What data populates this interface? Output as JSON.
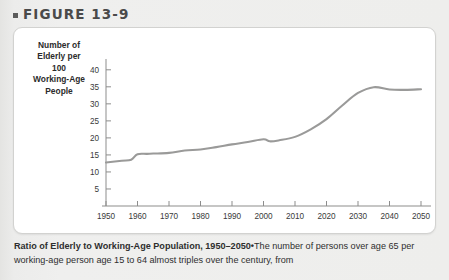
{
  "figure": {
    "marker": "▪",
    "label": "FIGURE 13-9"
  },
  "axis_label": {
    "line1": "Number of",
    "line2": "Elderly per",
    "line3": "100",
    "line4": "Working-Age",
    "line5": "People"
  },
  "caption": {
    "bold": "Ratio of Elderly to Working-Age Population, 1950–2050",
    "separator": "•",
    "text1": "The number of persons",
    "text2": "over age 65 per working-age person age 15 to 64 almost triples over the century, from"
  },
  "colors": {
    "line": "#9a9a99",
    "axis": "#8d8d8c",
    "panel_bg": "#ffffff",
    "page_bg": "#ededeb",
    "text": "#2b2b2b"
  },
  "chart_data": {
    "type": "line",
    "title": "Ratio of Elderly to Working-Age Population, 1950–2050",
    "xlabel": "",
    "ylabel": "Number of Elderly per 100 Working-Age People",
    "xlim": [
      1950,
      2050
    ],
    "ylim": [
      0,
      42
    ],
    "xticks": [
      1950,
      1960,
      1970,
      1980,
      1990,
      2000,
      2010,
      2020,
      2030,
      2040,
      2050
    ],
    "yticks": [
      5,
      10,
      15,
      20,
      25,
      30,
      35,
      40
    ],
    "grid": false,
    "legend": false,
    "series": [
      {
        "name": "Elderly per 100 working-age people",
        "x": [
          1950,
          1955,
          1958,
          1960,
          1963,
          1965,
          1970,
          1975,
          1980,
          1985,
          1990,
          1995,
          2000,
          2002,
          2005,
          2010,
          2015,
          2020,
          2025,
          2030,
          2035,
          2040,
          2045,
          2050
        ],
        "values": [
          12.8,
          13.3,
          13.6,
          15.2,
          15.3,
          15.4,
          15.6,
          16.3,
          16.6,
          17.3,
          18.1,
          18.8,
          19.6,
          19.0,
          19.3,
          20.3,
          22.5,
          25.5,
          29.5,
          33.2,
          34.9,
          34.2,
          34.1,
          34.3
        ]
      }
    ]
  }
}
